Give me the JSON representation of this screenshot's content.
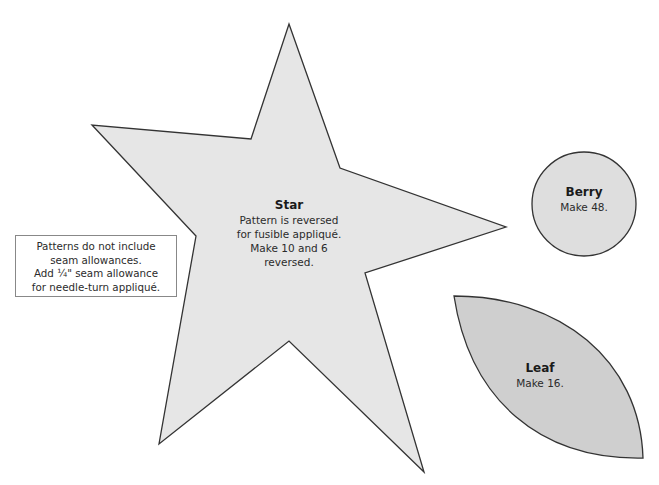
{
  "note": {
    "lines": [
      "Patterns do not include",
      "seam allowances.",
      "Add ¼\" seam allowance",
      "for needle-turn appliqué."
    ]
  },
  "shapes": {
    "star": {
      "title": "Star",
      "lines": [
        "Pattern is reversed",
        "for fusible appliqué.",
        "Make 10 and 6 reversed."
      ],
      "fill": "#e6e6e6"
    },
    "berry": {
      "title": "Berry",
      "lines": [
        "Make 48."
      ],
      "fill": "#dedede"
    },
    "leaf": {
      "title": "Leaf",
      "lines": [
        "Make 16."
      ],
      "fill": "#cfcfcf"
    }
  },
  "colors": {
    "outline": "#333333"
  }
}
